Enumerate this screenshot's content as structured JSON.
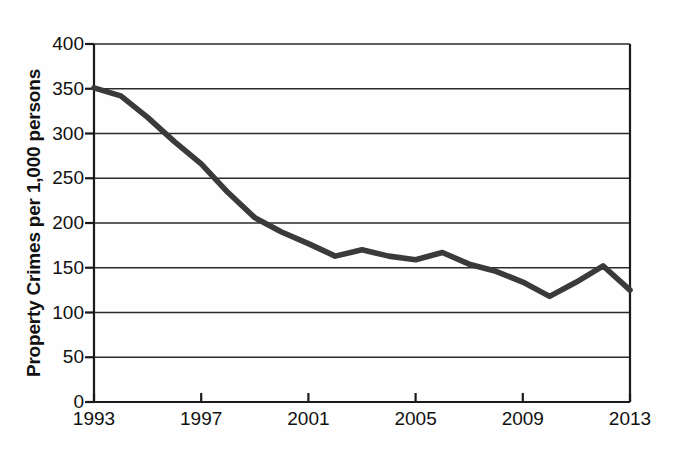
{
  "chart_data": {
    "type": "line",
    "title": "",
    "subtitle": "",
    "xlabel": "",
    "ylabel": "Property Crimes per 1,000 persons",
    "x": [
      1993,
      1994,
      1995,
      1996,
      1997,
      1998,
      1999,
      2000,
      2001,
      2002,
      2003,
      2004,
      2005,
      2006,
      2007,
      2008,
      2009,
      2010,
      2011,
      2012,
      2013
    ],
    "values": [
      351,
      342,
      318,
      291,
      266,
      234,
      206,
      190,
      177,
      163,
      170,
      163,
      159,
      167,
      154,
      146,
      134,
      118,
      134,
      152,
      125
    ],
    "series": [
      {
        "name": "Property Crimes per 1,000 persons",
        "values": [
          351,
          342,
          318,
          291,
          266,
          234,
          206,
          190,
          177,
          163,
          170,
          163,
          159,
          167,
          154,
          146,
          134,
          118,
          134,
          152,
          125
        ]
      }
    ],
    "xlim": [
      1993,
      2013
    ],
    "ylim": [
      0,
      400
    ],
    "x_ticks": [
      1993,
      1997,
      2001,
      2005,
      2009,
      2013
    ],
    "x_tick_labels": [
      "1993",
      "1997",
      "2001",
      "2005",
      "2009",
      "2013"
    ],
    "y_ticks": [
      0,
      50,
      100,
      150,
      200,
      250,
      300,
      350,
      400
    ],
    "y_tick_labels": [
      "0",
      "50",
      "100",
      "150",
      "200",
      "250",
      "300",
      "350",
      "400"
    ],
    "grid": "horizontal",
    "legend": "none",
    "line_color": "#3a3a3a",
    "axis_color": "#1a1a1a",
    "grid_color": "#2b2b2b",
    "annotations": []
  },
  "axes": {
    "y_title": "Property Crimes per 1,000 persons"
  }
}
